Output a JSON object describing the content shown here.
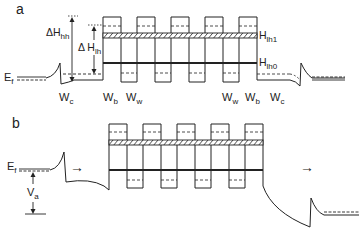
{
  "panel_a": {
    "label": "a",
    "fermi_label": "E",
    "fermi_sub": "f",
    "delta_hh_label": "ΔH",
    "delta_hh_sub": "hh",
    "delta_lh_label": "Δ H",
    "delta_lh_sub": "lh",
    "h_lh1_label": "H",
    "h_lh1_sub": "lh1",
    "h_lh0_label": "H",
    "h_lh0_sub": "lh0",
    "width_labels": [
      {
        "main": "W",
        "sub": "c"
      },
      {
        "main": "W",
        "sub": "b"
      },
      {
        "main": "W",
        "sub": "w"
      },
      {
        "main": "W",
        "sub": "w"
      },
      {
        "main": "W",
        "sub": "b"
      },
      {
        "main": "W",
        "sub": "c"
      }
    ]
  },
  "panel_b": {
    "label": "b",
    "fermi_label": "E",
    "fermi_sub": "f",
    "bias_label": "V",
    "bias_sub": "a",
    "arrow_left": "→",
    "arrow_right": "→"
  },
  "colors": {
    "line": "#222222",
    "background": "#ffffff"
  }
}
